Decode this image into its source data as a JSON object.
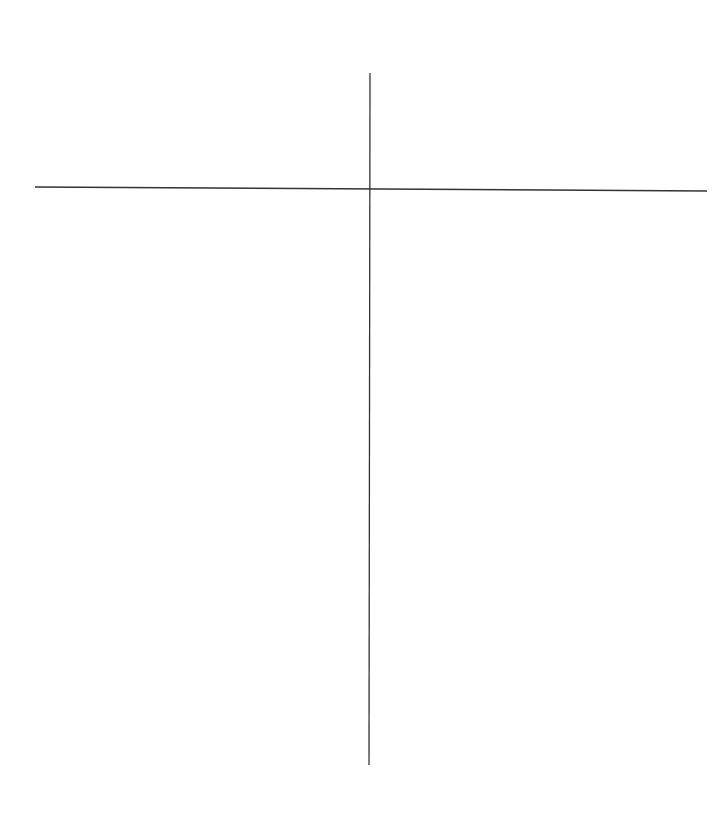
{
  "diagram": {
    "type": "t-chart",
    "line_color": "#333333",
    "vertical_line": {
      "x1": 370,
      "y1": 73,
      "x2": 369,
      "y2": 765,
      "stroke_width": 1.3
    },
    "horizontal_line": {
      "x1": 35,
      "y1": 187,
      "x2": 707,
      "y2": 191,
      "stroke_width": 1.5
    },
    "left_column_header": "",
    "right_column_header": "",
    "left_items": [],
    "right_items": []
  }
}
